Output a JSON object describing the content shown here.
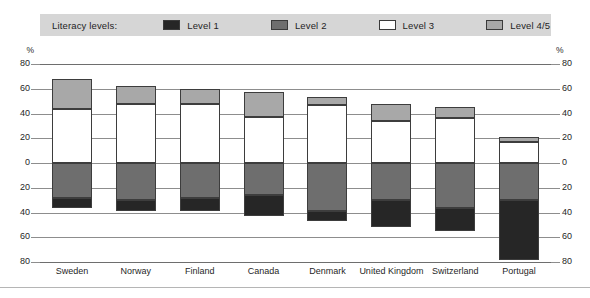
{
  "legend": {
    "title": "Literacy levels:",
    "items": [
      {
        "label": "Level 1",
        "color": "#262626",
        "icon": "legend-swatch-level-1"
      },
      {
        "label": "Level 2",
        "color": "#6e6e6e",
        "icon": "legend-swatch-level-2"
      },
      {
        "label": "Level 3",
        "color": "#ffffff",
        "icon": "legend-swatch-level-3"
      },
      {
        "label": "Level 4/5",
        "color": "#a8a8a8",
        "icon": "legend-swatch-level-4-5"
      }
    ],
    "background": "#d6d6d6"
  },
  "axis": {
    "unit_left": "%",
    "unit_right": "%",
    "ticks": [
      "80",
      "60",
      "40",
      "20",
      "0",
      "20",
      "40",
      "60",
      "80"
    ]
  },
  "chart_data": {
    "type": "bar",
    "title": "",
    "subtitle": "",
    "xlabel": "",
    "ylabel": "%",
    "stacked": true,
    "orientation": "vertical",
    "diverging_baseline": 0,
    "grid": true,
    "legend_position": "top",
    "ylim": [
      -80,
      80
    ],
    "yticks": [
      80,
      60,
      40,
      20,
      0,
      -20,
      -40,
      -60,
      -80
    ],
    "ytick_labels": [
      "80",
      "60",
      "40",
      "20",
      "0",
      "20",
      "40",
      "60",
      "80"
    ],
    "categories": [
      "Sweden",
      "Norway",
      "Finland",
      "Canada",
      "Denmark",
      "United Kingdom",
      "Switzerland",
      "Portugal"
    ],
    "series": [
      {
        "name": "Level 1",
        "color": "#262626",
        "direction": "down",
        "values": [
          8,
          9,
          11,
          17,
          8,
          22,
          19,
          48
        ]
      },
      {
        "name": "Level 2",
        "color": "#6e6e6e",
        "direction": "down",
        "values": [
          28,
          30,
          28,
          26,
          39,
          30,
          36,
          30
        ]
      },
      {
        "name": "Level 3",
        "color": "#ffffff",
        "direction": "up",
        "values": [
          44,
          48,
          48,
          37,
          47,
          34,
          36,
          17
        ]
      },
      {
        "name": "Level 4/5",
        "color": "#a8a8a8",
        "direction": "up",
        "values": [
          24,
          14,
          12,
          20,
          6,
          14,
          9,
          4
        ]
      }
    ]
  }
}
